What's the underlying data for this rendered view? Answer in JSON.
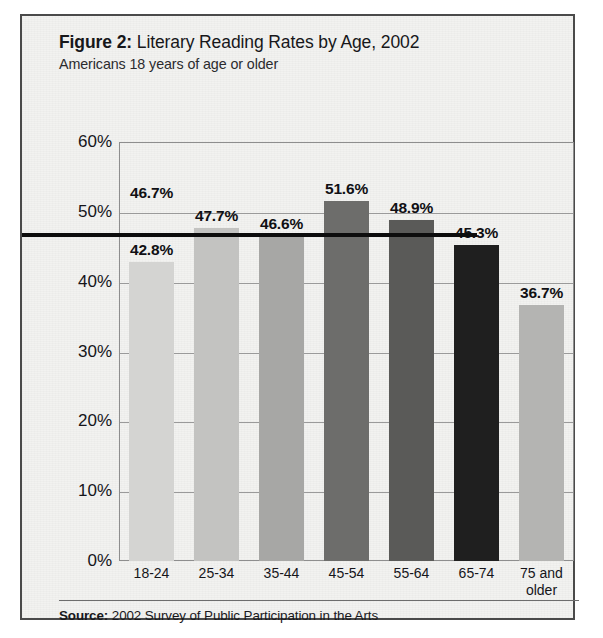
{
  "figure": {
    "figure_label": "Figure 2:",
    "title": "Literary Reading Rates by Age, 2002",
    "subtitle": "Americans 18 years of age or older",
    "source_label": "Source:",
    "source_text": "2002 Survey of Public Participation in the Arts"
  },
  "chart_data": {
    "type": "bar",
    "title": "Figure 2: Literary Reading Rates by Age, 2002",
    "subtitle": "Americans 18 years of age or older",
    "xlabel": "",
    "ylabel": "",
    "ylim": [
      0,
      60
    ],
    "ytick_step": 10,
    "grid": true,
    "legend": "none",
    "y_unit": "%",
    "categories": [
      "18-24",
      "25-34",
      "35-44",
      "45-54",
      "55-64",
      "65-74",
      "75 and older"
    ],
    "category_lines": [
      [
        "18-24"
      ],
      [
        "25-34"
      ],
      [
        "35-44"
      ],
      [
        "45-54"
      ],
      [
        "55-64"
      ],
      [
        "65-74"
      ],
      [
        "75 and",
        "older"
      ]
    ],
    "values": [
      42.8,
      47.7,
      46.6,
      51.6,
      48.9,
      45.3,
      36.7
    ],
    "value_labels": [
      "42.8%",
      "47.7%",
      "46.6%",
      "51.6%",
      "48.9%",
      "45.3%",
      "36.7%"
    ],
    "bar_colors": [
      "#d4d4d2",
      "#c3c3c1",
      "#a7a7a5",
      "#6d6d6b",
      "#5a5a58",
      "#1f1f1f",
      "#b4b4b2"
    ],
    "ytick_labels": [
      "0%",
      "10%",
      "20%",
      "30%",
      "40%",
      "50%",
      "60%"
    ],
    "ytick_values": [
      0,
      10,
      20,
      30,
      40,
      50,
      60
    ],
    "reference_line": {
      "value": 46.7,
      "label": "46.7%",
      "color": "#0d0d0d",
      "description": "overall literary reading rate for all adults"
    }
  }
}
